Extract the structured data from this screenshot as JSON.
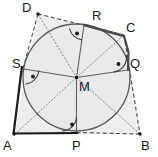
{
  "figure": {
    "colors": {
      "stroke": "#3a3a3a",
      "solid_side": "#1a1a1a",
      "dashed_side": "#4a4a4a",
      "circle": "#555555",
      "radius": "#555555",
      "dotted_diagonal": "#777777",
      "fill": "#eeeeee",
      "label": "#1a1a1a"
    },
    "points": [
      {
        "name": "A",
        "x": 14,
        "y": 135,
        "label": "A",
        "label_x": 3,
        "label_y": 139,
        "kind": "vertex"
      },
      {
        "name": "B",
        "x": 140,
        "y": 134,
        "label": "B",
        "label_x": 141,
        "label_y": 139,
        "kind": "vertex"
      },
      {
        "name": "C",
        "x": 124,
        "y": 35,
        "label": "C",
        "label_x": 126,
        "label_y": 21,
        "kind": "vertex"
      },
      {
        "name": "D",
        "x": 38,
        "y": 14,
        "label": "D",
        "label_x": 22,
        "label_y": 1,
        "kind": "vertex"
      },
      {
        "name": "M",
        "x": 76.5,
        "y": 77.5,
        "label": "M",
        "label_x": 79,
        "label_y": 80,
        "kind": "center"
      },
      {
        "name": "P",
        "x": 76.5,
        "y": 131,
        "label": "P",
        "label_x": 72,
        "label_y": 139,
        "kind": "tangent"
      },
      {
        "name": "Q",
        "x": 128,
        "y": 70,
        "label": "Q",
        "label_x": 130,
        "label_y": 57,
        "kind": "tangent"
      },
      {
        "name": "R",
        "x": 84,
        "y": 25,
        "label": "R",
        "label_x": 92,
        "label_y": 9,
        "kind": "tangent"
      },
      {
        "name": "S",
        "x": 24,
        "y": 69,
        "label": "S",
        "label_x": 12,
        "label_y": 57,
        "kind": "tangent"
      }
    ],
    "circle": {
      "cx": 76.5,
      "cy": 77.5,
      "r": 53.5,
      "label": "incircle"
    },
    "sides": [
      {
        "name": "AB",
        "from": "A",
        "to": "B",
        "style": "solid-then-dashed",
        "note": "AP solid, PB dashed"
      },
      {
        "name": "BC",
        "from": "B",
        "to": "C",
        "style": "dashed"
      },
      {
        "name": "CD",
        "from": "C",
        "to": "D",
        "style": "dashed"
      },
      {
        "name": "DA",
        "from": "D",
        "to": "A",
        "style": "dashed-then-solid",
        "note": "DS dashed, SA solid"
      }
    ],
    "radii": [
      {
        "name": "MP",
        "from": "M",
        "to": "P"
      },
      {
        "name": "MQ",
        "from": "M",
        "to": "Q"
      },
      {
        "name": "MR",
        "from": "M",
        "to": "R"
      },
      {
        "name": "MS",
        "from": "M",
        "to": "S"
      }
    ],
    "diagonals": [
      {
        "name": "MA",
        "from": "M",
        "to": "A",
        "style": "dotted"
      },
      {
        "name": "MB",
        "from": "M",
        "to": "B",
        "style": "dotted"
      },
      {
        "name": "MC",
        "from": "M",
        "to": "C",
        "style": "dotted"
      },
      {
        "name": "MD",
        "from": "M",
        "to": "D",
        "style": "dotted"
      }
    ],
    "right_angle_marks": [
      {
        "name": "angle-at-P",
        "at": "P",
        "marker": "arc-with-dot"
      },
      {
        "name": "angle-at-Q",
        "at": "Q",
        "marker": "arc-with-dot"
      },
      {
        "name": "angle-at-R",
        "at": "R",
        "marker": "arc-with-dot"
      },
      {
        "name": "angle-at-S",
        "at": "S",
        "marker": "arc-with-dot"
      }
    ]
  }
}
